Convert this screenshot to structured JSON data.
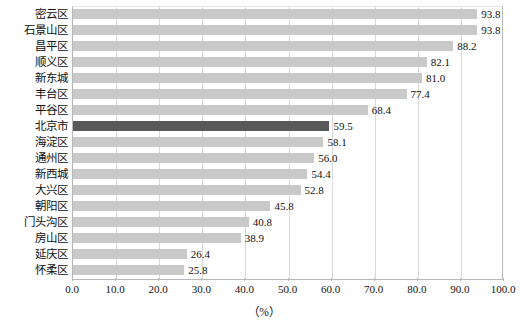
{
  "chart_data": {
    "type": "bar",
    "orientation": "horizontal",
    "title": "",
    "xlabel": "（%）",
    "ylabel": "",
    "xlim": [
      0,
      100
    ],
    "xticks": [
      "0.0",
      "10.0",
      "20.0",
      "30.0",
      "40.0",
      "50.0",
      "60.0",
      "70.0",
      "80.0",
      "90.0",
      "100.0"
    ],
    "grid": true,
    "legend": "none",
    "categories": [
      "密云区",
      "石景山区",
      "昌平区",
      "顺义区",
      "新东城",
      "丰台区",
      "平谷区",
      "北京市",
      "海淀区",
      "通州区",
      "新西城",
      "大兴区",
      "朝阳区",
      "门头沟区",
      "房山区",
      "延庆区",
      "怀柔区"
    ],
    "values": [
      93.8,
      93.8,
      88.2,
      82.1,
      81.0,
      77.4,
      68.4,
      59.5,
      58.1,
      56.0,
      54.4,
      52.8,
      45.8,
      40.8,
      38.9,
      26.4,
      25.8
    ],
    "value_labels": [
      "93.8",
      "93.8",
      "88.2",
      "82.1",
      "81.0",
      "77.4",
      "68.4",
      "59.5",
      "58.1",
      "56.0",
      "54.4",
      "52.8",
      "45.8",
      "40.8",
      "38.9",
      "26.4",
      "25.8"
    ],
    "highlight_category": "北京市",
    "colors": {
      "bar": "#c9c9c9",
      "bar_highlight": "#595959",
      "gridline": "#d9d9d9",
      "axis": "#b8b8b8",
      "text": "#111111",
      "background": "#ffffff"
    }
  }
}
